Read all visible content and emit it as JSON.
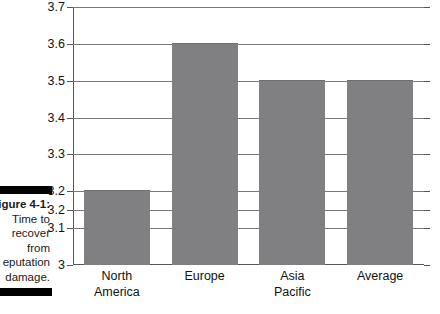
{
  "figure": {
    "caption_lines": [
      "igure 4-1:",
      "Time to",
      "recover",
      "from",
      "eputation",
      "damage."
    ],
    "caption_bold_index": 0
  },
  "chart_data": {
    "type": "bar",
    "title": "",
    "subtitle": "",
    "xlabel": "",
    "ylabel": "",
    "categories": [
      "North America",
      "Europe",
      "Asia Pacific",
      "Average"
    ],
    "values": [
      3.2,
      3.6,
      3.5,
      3.5
    ],
    "series": [
      {
        "name": "Time to recover from reputation damage",
        "values": [
          3.2,
          3.6,
          3.5,
          3.5
        ]
      }
    ],
    "ylim": [
      3.0,
      3.7
    ],
    "ytick_labels": [
      "3.7",
      "3.6",
      "3.5",
      "3.4",
      "3.3",
      "3.2",
      "3.2",
      "3.1",
      "3"
    ],
    "ytick_values": [
      3.7,
      3.6,
      3.5,
      3.4,
      3.3,
      3.2,
      3.15,
      3.1,
      3.0
    ],
    "grid": true,
    "legend": false,
    "legend_position": "none",
    "bar_color": "#807f82",
    "gridline_color": "#77777c",
    "axis_color": "#55555a",
    "text_color": "#111111",
    "background": "#ffffff"
  },
  "xlabel_lines": [
    [
      "North",
      "America"
    ],
    [
      "Europe"
    ],
    [
      "Asia",
      "Pacific"
    ],
    [
      "Average"
    ]
  ]
}
